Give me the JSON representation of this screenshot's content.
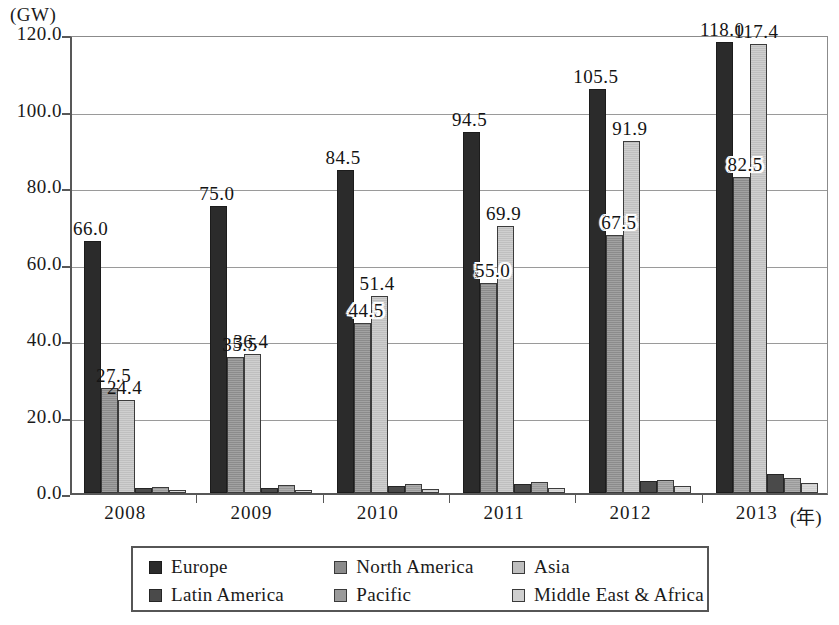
{
  "chart_data": {
    "type": "bar",
    "title": "",
    "subtitle": "",
    "xlabel": "(年)",
    "ylabel": "(GW)",
    "unit": "GW",
    "ylim": [
      0.0,
      120.0
    ],
    "ytick_step": 20.0,
    "grid": true,
    "legend_position": "bottom",
    "categories": [
      "2008",
      "2009",
      "2010",
      "2011",
      "2012",
      "2013"
    ],
    "ytick_labels": [
      "0.0",
      "20.0",
      "40.0",
      "60.0",
      "80.0",
      "100.0",
      "120.0"
    ],
    "ytick_values": [
      0.0,
      20.0,
      40.0,
      60.0,
      80.0,
      100.0,
      120.0
    ],
    "series": [
      {
        "name": "Europe",
        "color": "#2b2b2b",
        "values": [
          66.0,
          75.0,
          84.5,
          94.5,
          105.5,
          118.0
        ],
        "labels": [
          "66.0",
          "75.0",
          "84.5",
          "94.5",
          "105.5",
          "118.0"
        ],
        "labels_shown": true
      },
      {
        "name": "North America",
        "color": "#8b8b8b",
        "values": [
          27.5,
          35.5,
          44.5,
          55.0,
          67.5,
          82.5
        ],
        "labels": [
          "27.5",
          "35.5",
          "44.5",
          "55.0",
          "67.5",
          "82.5"
        ],
        "labels_shown": true
      },
      {
        "name": "Asia",
        "color": "#bfbfbf",
        "values": [
          24.4,
          36.4,
          51.4,
          69.9,
          91.9,
          117.4
        ],
        "labels": [
          "24.4",
          "36.4",
          "51.4",
          "69.9",
          "91.9",
          "117.4"
        ],
        "labels_shown": true
      },
      {
        "name": "Latin America",
        "color": "#4a4a4a",
        "values": [
          1.3,
          1.4,
          1.8,
          2.3,
          3.2,
          5.0
        ],
        "labels": [
          "",
          "",
          "",
          "",
          "",
          ""
        ],
        "labels_shown": false
      },
      {
        "name": "Pacific",
        "color": "#9a9a9a",
        "values": [
          1.6,
          2.1,
          2.3,
          3.0,
          3.4,
          4.0
        ],
        "labels": [
          "",
          "",
          "",
          "",
          "",
          ""
        ],
        "labels_shown": false
      },
      {
        "name": "Middle East & Africa",
        "color": "#cfcfcf",
        "values": [
          0.7,
          0.8,
          1.1,
          1.2,
          1.8,
          2.5
        ],
        "labels": [
          "",
          "",
          "",
          "",
          "",
          ""
        ],
        "labels_shown": false
      }
    ]
  },
  "legend": {
    "rows": [
      [
        {
          "label": "Europe",
          "series": 0
        },
        {
          "label": "North America",
          "series": 1
        },
        {
          "label": "Asia",
          "series": 2
        }
      ],
      [
        {
          "label": "Latin America",
          "series": 3
        },
        {
          "label": "Pacific",
          "series": 4
        },
        {
          "label": "Middle East & Africa",
          "series": 5
        }
      ]
    ]
  }
}
